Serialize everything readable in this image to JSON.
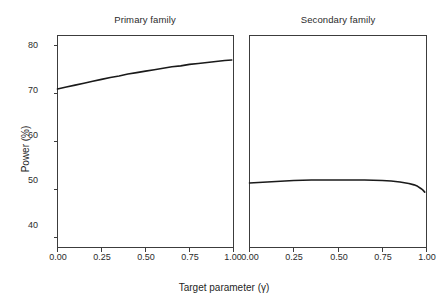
{
  "figure": {
    "xlabel": "Target parameter (γ)",
    "ylabel": "Power (%)",
    "background": "#ffffff",
    "line_color": "#1a1a1a",
    "axis_color": "#3c3c3c"
  },
  "chart_data": {
    "type": "line",
    "title": "",
    "xlabel": "Target parameter (γ)",
    "ylabel": "Power (%)",
    "xlim": [
      0.0,
      1.0
    ],
    "ylim": [
      38.0,
      82.0
    ],
    "xticks": [
      0.0,
      0.25,
      0.5,
      0.75,
      1.0
    ],
    "xticklabels": [
      "0.00",
      "0.25",
      "0.50",
      "0.75",
      "1.00"
    ],
    "yticks": [
      40,
      50,
      60,
      70,
      80
    ],
    "yticklabels": [
      "40",
      "50",
      "60",
      "70",
      "80"
    ],
    "grid": false,
    "legend": false,
    "panels": [
      {
        "title": "Primary family",
        "series": [
          {
            "name": "Primary family",
            "x": [
              0.0,
              0.05,
              0.1,
              0.15,
              0.2,
              0.25,
              0.3,
              0.35,
              0.4,
              0.45,
              0.5,
              0.55,
              0.6,
              0.65,
              0.7,
              0.75,
              0.8,
              0.85,
              0.9,
              0.95,
              0.99
            ],
            "values": [
              70.9,
              71.3,
              71.7,
              72.1,
              72.5,
              72.9,
              73.3,
              73.6,
              74.0,
              74.3,
              74.6,
              74.9,
              75.2,
              75.5,
              75.7,
              76.0,
              76.2,
              76.4,
              76.6,
              76.8,
              76.9
            ]
          }
        ]
      },
      {
        "title": "Secondary family",
        "series": [
          {
            "name": "Secondary family",
            "x": [
              0.0,
              0.05,
              0.1,
              0.15,
              0.2,
              0.25,
              0.3,
              0.35,
              0.4,
              0.45,
              0.5,
              0.55,
              0.6,
              0.65,
              0.7,
              0.75,
              0.8,
              0.85,
              0.9,
              0.93,
              0.95,
              0.97,
              0.98,
              0.99
            ],
            "values": [
              51.4,
              51.5,
              51.6,
              51.7,
              51.8,
              51.9,
              51.95,
              52.0,
              52.0,
              52.0,
              52.0,
              52.0,
              52.0,
              52.0,
              51.95,
              51.9,
              51.8,
              51.6,
              51.3,
              51.0,
              50.7,
              50.2,
              49.9,
              49.5
            ]
          }
        ]
      }
    ]
  },
  "panel_titles": {
    "primary": "Primary family",
    "secondary": "Secondary family"
  },
  "ticks": {
    "y": [
      "80",
      "70",
      "60",
      "50",
      "40"
    ],
    "x": [
      "0.00",
      "0.25",
      "0.50",
      "0.75",
      "1.00"
    ]
  }
}
